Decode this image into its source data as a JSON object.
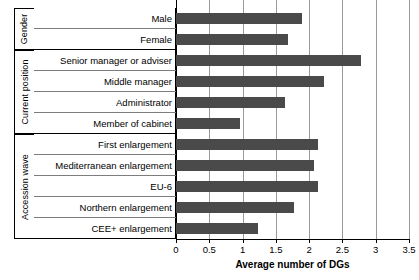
{
  "chart_data": {
    "type": "bar",
    "orientation": "horizontal",
    "title": "",
    "xlabel": "Average number of DGs",
    "ylabel": "",
    "xlim": [
      0,
      3.5
    ],
    "xticks": [
      "0",
      "0.5",
      "1",
      "1.5",
      "2",
      "2.5",
      "3",
      "3.5"
    ],
    "xtick_values": [
      0,
      0.5,
      1,
      1.5,
      2,
      2.5,
      3,
      3.5
    ],
    "grid": true,
    "legend": "none",
    "bar_color": "#4a4a4a",
    "groups": [
      {
        "name": "Gender",
        "categories": [
          "Male",
          "Female"
        ],
        "values": [
          1.9,
          1.68
        ]
      },
      {
        "name": "Current position",
        "categories": [
          "Senior manager or adviser",
          "Middle manager",
          "Administrator",
          "Member of cabinet"
        ],
        "values": [
          2.78,
          2.22,
          1.64,
          0.96
        ]
      },
      {
        "name": "Accession wave",
        "categories": [
          "First enlargement",
          "Mediterranean enlargement",
          "EU-6",
          "Northern enlargement",
          "CEE+ enlargement"
        ],
        "values": [
          2.14,
          2.08,
          2.14,
          1.78,
          1.23
        ]
      }
    ],
    "categories": [
      "Male",
      "Female",
      "Senior manager or adviser",
      "Middle manager",
      "Administrator",
      "Member of cabinet",
      "First enlargement",
      "Mediterranean enlargement",
      "EU-6",
      "Northern enlargement",
      "CEE+ enlargement"
    ],
    "values": [
      1.9,
      1.68,
      2.78,
      2.22,
      1.64,
      0.96,
      2.14,
      2.08,
      2.14,
      1.78,
      1.23
    ]
  }
}
